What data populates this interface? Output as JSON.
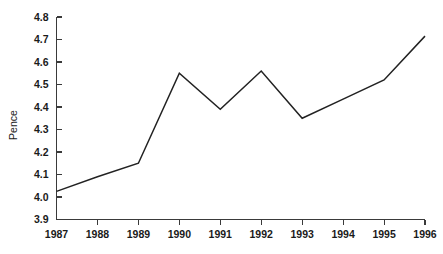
{
  "chart_data": {
    "type": "line",
    "title": "",
    "xlabel": "",
    "ylabel": "Pence",
    "x": [
      1987,
      1988,
      1989,
      1990,
      1991,
      1992,
      1993,
      1994,
      1995,
      1996
    ],
    "categories": [
      "1987",
      "1988",
      "1989",
      "1990",
      "1991",
      "1992",
      "1993",
      "1994",
      "1995",
      "1996"
    ],
    "values": [
      4.025,
      4.09,
      4.15,
      4.55,
      4.39,
      4.56,
      4.35,
      4.435,
      4.52,
      4.715
    ],
    "series": [
      {
        "name": "Pence",
        "values": [
          4.025,
          4.09,
          4.15,
          4.55,
          4.39,
          4.56,
          4.35,
          4.435,
          4.52,
          4.715
        ]
      }
    ],
    "ylim": [
      3.9,
      4.8
    ],
    "xlim": [
      1987,
      1996
    ],
    "yticks": [
      3.9,
      4.0,
      4.1,
      4.2,
      4.3,
      4.4,
      4.5,
      4.6,
      4.7,
      4.8
    ],
    "ytick_labels": [
      "3.9",
      "4.0",
      "4.1",
      "4.2",
      "4.3",
      "4.4",
      "4.5",
      "4.6",
      "4.7",
      "4.8"
    ],
    "xticks": [
      1987,
      1988,
      1989,
      1990,
      1991,
      1992,
      1993,
      1994,
      1995,
      1996
    ],
    "xtick_labels": [
      "1987",
      "1988",
      "1989",
      "1990",
      "1991",
      "1992",
      "1993",
      "1994",
      "1995",
      "1996"
    ],
    "grid": false,
    "legend": false,
    "legend_position": "none",
    "line_color": "#222222",
    "axis_color": "#3a3a3a",
    "background_color": "#ffffff"
  }
}
